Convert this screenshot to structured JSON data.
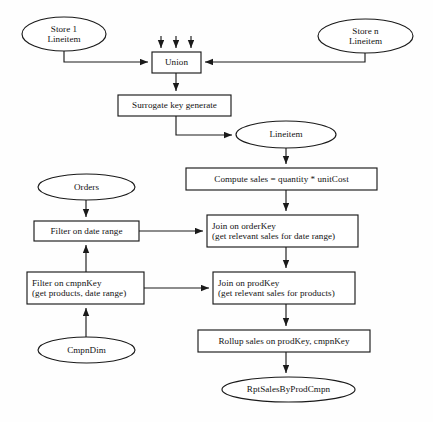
{
  "diagram": {
    "style": {
      "stroke_color": "#1a1a1a",
      "fill_color": "#ffffff",
      "background": "#fefefe",
      "text_color": "#111111"
    },
    "nodes": [
      {
        "id": "store1-lineitem",
        "name": "store-1-lineitem-source",
        "shape": "ellipse",
        "lines": [
          "Store 1",
          "Lineitem"
        ],
        "x": 22,
        "y": 17,
        "w": 84,
        "h": 34
      },
      {
        "id": "storen-lineitem",
        "name": "store-n-lineitem-source",
        "shape": "ellipse",
        "lines": [
          "Store n",
          "Lineitem"
        ],
        "x": 318,
        "y": 19,
        "w": 95,
        "h": 34
      },
      {
        "id": "union",
        "name": "union-step",
        "shape": "rect",
        "lines": [
          "Union"
        ],
        "x": 152,
        "y": 52,
        "w": 49,
        "h": 21
      },
      {
        "id": "surrogate-key",
        "name": "surrogate-key-generate-step",
        "shape": "rect",
        "lines": [
          "Surrogate key generate"
        ],
        "x": 118,
        "y": 95,
        "w": 113,
        "h": 21
      },
      {
        "id": "lineitem",
        "name": "lineitem-dataset",
        "shape": "ellipse",
        "lines": [
          "Lineitem"
        ],
        "x": 236,
        "y": 121,
        "w": 100,
        "h": 27
      },
      {
        "id": "orders",
        "name": "orders-dataset",
        "shape": "ellipse",
        "lines": [
          "Orders"
        ],
        "x": 38,
        "y": 174,
        "w": 97,
        "h": 26
      },
      {
        "id": "compute-sales",
        "name": "compute-sales-step",
        "shape": "rect",
        "lines": [
          "Compute sales = quantity * unitCost"
        ],
        "x": 186,
        "y": 168,
        "w": 191,
        "h": 22
      },
      {
        "id": "filter-date-range",
        "name": "filter-on-date-range-step",
        "shape": "rect",
        "lines": [
          "Filter on date range"
        ],
        "x": 34,
        "y": 221,
        "w": 105,
        "h": 20
      },
      {
        "id": "join-orderkey",
        "name": "join-on-orderkey-step",
        "shape": "rect",
        "lines": [
          "Join on orderKey",
          "(get relevant sales for date range)"
        ],
        "x": 207,
        "y": 215,
        "w": 151,
        "h": 32
      },
      {
        "id": "filter-cmpnkey",
        "name": "filter-on-cmpnkey-step",
        "shape": "rect",
        "lines": [
          "Filter on cmpnKey",
          "(get products, date range)"
        ],
        "x": 27,
        "y": 272,
        "w": 117,
        "h": 32
      },
      {
        "id": "join-prodkey",
        "name": "join-on-prodkey-step",
        "shape": "rect",
        "lines": [
          "Join on prodKey",
          "(get relevant sales for products)"
        ],
        "x": 213,
        "y": 272,
        "w": 142,
        "h": 32
      },
      {
        "id": "cmpndim",
        "name": "cmpndim-dataset",
        "shape": "ellipse",
        "lines": [
          "CmpnDim"
        ],
        "x": 38,
        "y": 337,
        "w": 97,
        "h": 26
      },
      {
        "id": "rollup-sales",
        "name": "rollup-sales-step",
        "shape": "rect",
        "lines": [
          "Rollup sales on prodKey, cmpnKey"
        ],
        "x": 198,
        "y": 330,
        "w": 172,
        "h": 22
      },
      {
        "id": "rpt-sales",
        "name": "rpt-sales-by-prod-cmpn-output",
        "shape": "ellipse",
        "lines": [
          "RptSalesByProdCmpn"
        ],
        "x": 222,
        "y": 377,
        "w": 133,
        "h": 25
      }
    ],
    "edges": [
      {
        "name": "edge-store1-to-union",
        "from": "store1-lineitem",
        "to": "union",
        "path": "M64,51 L64,62 L148,62",
        "arrow": "right"
      },
      {
        "name": "edge-storen-to-union",
        "from": "storen-lineitem",
        "to": "union",
        "path": "M365,53 L365,62 L205,62",
        "arrow": "left"
      },
      {
        "name": "edge-ellipsis-1",
        "from": "",
        "to": "union",
        "path": "M161,36 L161,48",
        "arrow": "down"
      },
      {
        "name": "edge-ellipsis-2",
        "from": "",
        "to": "union",
        "path": "M176,36 L176,48",
        "arrow": "down"
      },
      {
        "name": "edge-ellipsis-3",
        "from": "",
        "to": "union",
        "path": "M191,36 L191,48",
        "arrow": "down"
      },
      {
        "name": "edge-union-to-surrogate",
        "from": "union",
        "to": "surrogate-key",
        "path": "M176,73 L176,91",
        "arrow": "down"
      },
      {
        "name": "edge-surrogate-to-lineitem",
        "from": "surrogate-key",
        "to": "lineitem",
        "path": "M176,116 L176,135 L232,135",
        "arrow": "right"
      },
      {
        "name": "edge-lineitem-to-compute",
        "from": "lineitem",
        "to": "compute-sales",
        "path": "M286,148 L286,164",
        "arrow": "down"
      },
      {
        "name": "edge-compute-to-join-orderkey",
        "from": "compute-sales",
        "to": "join-orderkey",
        "path": "M286,190 L286,211",
        "arrow": "down"
      },
      {
        "name": "edge-orders-to-filter-date",
        "from": "orders",
        "to": "filter-date-range",
        "path": "M86,200 L86,217",
        "arrow": "down"
      },
      {
        "name": "edge-filter-date-to-join-orderkey",
        "from": "filter-date-range",
        "to": "join-orderkey",
        "path": "M139,231 L203,231",
        "arrow": "right"
      },
      {
        "name": "edge-filter-cmpnkey-to-filter-date",
        "from": "filter-cmpnkey",
        "to": "filter-date-range",
        "path": "M86,272 L86,245",
        "arrow": "up"
      },
      {
        "name": "edge-join-orderkey-to-join-prodkey",
        "from": "join-orderkey",
        "to": "join-prodkey",
        "path": "M286,247 L286,268",
        "arrow": "down"
      },
      {
        "name": "edge-filter-cmpnkey-to-join-prodkey",
        "from": "filter-cmpnkey",
        "to": "join-prodkey",
        "path": "M144,288 L209,288",
        "arrow": "right"
      },
      {
        "name": "edge-cmpndim-to-filter-cmpnkey",
        "from": "cmpndim",
        "to": "filter-cmpnkey",
        "path": "M86,337 L86,308",
        "arrow": "up"
      },
      {
        "name": "edge-join-prodkey-to-rollup",
        "from": "join-prodkey",
        "to": "rollup-sales",
        "path": "M286,304 L286,326",
        "arrow": "down"
      },
      {
        "name": "edge-rollup-to-rpt",
        "from": "rollup-sales",
        "to": "rpt-sales",
        "path": "M286,352 L286,373",
        "arrow": "down"
      }
    ]
  }
}
